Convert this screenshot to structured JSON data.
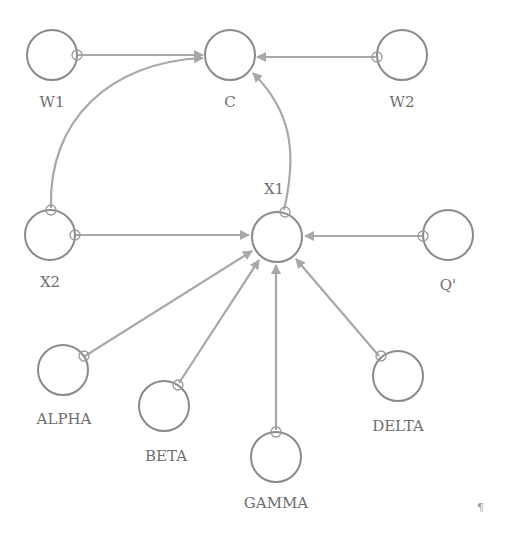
{
  "diagram": {
    "colors": {
      "node_stroke": "#8a8a8a",
      "edge": "#a8a8a8",
      "label": "#6e6e6e"
    },
    "nodes": [
      {
        "id": "W1",
        "label": "W1",
        "cx": 52,
        "cy": 55
      },
      {
        "id": "C",
        "label": "C",
        "cx": 230,
        "cy": 55
      },
      {
        "id": "W2",
        "label": "W2",
        "cx": 402,
        "cy": 55
      },
      {
        "id": "X2",
        "label": "X2",
        "cx": 50,
        "cy": 235
      },
      {
        "id": "X1",
        "label": "X1",
        "cx": 277,
        "cy": 237
      },
      {
        "id": "Q",
        "label": "Q'",
        "cx": 448,
        "cy": 235
      },
      {
        "id": "ALPHA",
        "label": "ALPHA",
        "cx": 63,
        "cy": 370
      },
      {
        "id": "BETA",
        "label": "BETA",
        "cx": 164,
        "cy": 406
      },
      {
        "id": "GAMMA",
        "label": "GAMMA",
        "cx": 276,
        "cy": 457
      },
      {
        "id": "DELTA",
        "label": "DELTA",
        "cx": 398,
        "cy": 376
      }
    ],
    "edges": [
      {
        "from": "W1",
        "to": "C"
      },
      {
        "from": "W2",
        "to": "C"
      },
      {
        "from": "X2",
        "to": "C",
        "curved": true
      },
      {
        "from": "X1",
        "to": "C",
        "curved": true
      },
      {
        "from": "X2",
        "to": "X1"
      },
      {
        "from": "Q",
        "to": "X1"
      },
      {
        "from": "ALPHA",
        "to": "X1"
      },
      {
        "from": "BETA",
        "to": "X1"
      },
      {
        "from": "GAMMA",
        "to": "X1"
      },
      {
        "from": "DELTA",
        "to": "X1"
      }
    ],
    "paragraph_mark": "¶"
  }
}
